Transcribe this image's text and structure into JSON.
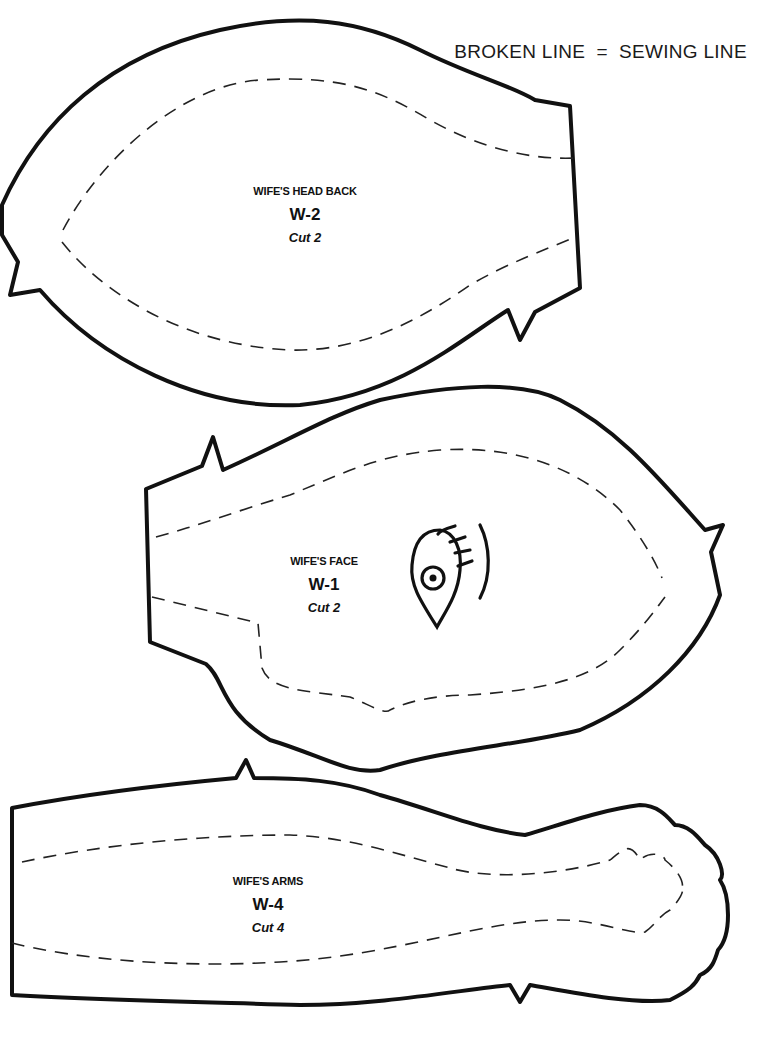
{
  "legend": {
    "text": "BROKEN LINE  =  SEWING LINE",
    "broken_line_label": "BROKEN LINE",
    "equals": "=",
    "sewing_line_label": "SEWING LINE"
  },
  "pieces": [
    {
      "id": "head-back",
      "name": "WIFE'S HEAD BACK",
      "code": "W-2",
      "cut": "Cut 2"
    },
    {
      "id": "face",
      "name": "WIFE'S FACE",
      "code": "W-1",
      "cut": "Cut 2",
      "marking": "eye-placement"
    },
    {
      "id": "arms",
      "name": "WIFE'S ARMS",
      "code": "W-4",
      "cut": "Cut 4"
    }
  ],
  "colors": {
    "line": "#111111",
    "background": "#ffffff"
  }
}
